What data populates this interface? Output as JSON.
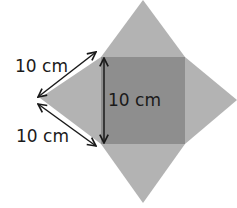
{
  "diagram": {
    "type": "square-pyramid-net",
    "colors": {
      "triangles": "#b3b3b3",
      "base_square": "#8e8e8e",
      "arrows": "#1a1a1a",
      "background": "#ffffff"
    },
    "labels": {
      "upper_slant": "10 cm",
      "lower_slant": "10 cm",
      "base_side": "10 cm"
    }
  }
}
